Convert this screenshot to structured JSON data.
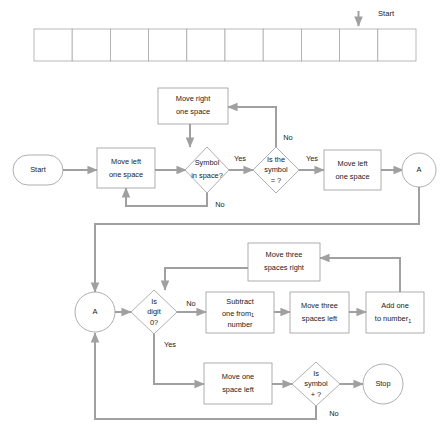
{
  "diagram": {
    "title_hidden": "",
    "colors": {
      "shape_border": "#9a9a9a",
      "connector": "#a0a0a0",
      "text": "#1a1a1a",
      "background": "#ffffff"
    },
    "tape": {
      "label": "Start",
      "cell_count": 10,
      "pointer_cell_index": 8,
      "cells": [
        "",
        "",
        "",
        "",
        "",
        "",
        "",
        "",
        "",
        ""
      ]
    },
    "nodes": {
      "start": {
        "label": "Start",
        "shape": "stadium"
      },
      "move_left_one_space_1": {
        "line1": "Move left",
        "line2": "one space",
        "shape": "process"
      },
      "symbol_in_space": {
        "line1": "Symbol",
        "line2": "in space?",
        "shape": "decision"
      },
      "move_right_one_space": {
        "line1": "Move right",
        "line2": "one space",
        "shape": "process"
      },
      "is_the_symbol_equals": {
        "line1": "Is the",
        "line2": "symbol",
        "line3": "= ?",
        "shape": "decision"
      },
      "move_left_one_space_2": {
        "line1": "Move left",
        "line2": "one space",
        "shape": "process"
      },
      "connector_a_top": {
        "label": "A",
        "shape": "connector"
      },
      "connector_a_bottom": {
        "label": "A",
        "shape": "connector"
      },
      "is_digit_0": {
        "line1": "Is",
        "line2": "digit",
        "line3": "0?",
        "shape": "decision"
      },
      "subtract_one": {
        "line1": "Subtract",
        "line2": "one from",
        "line2_sub": "1",
        "line3": "number",
        "shape": "process"
      },
      "move_three_spaces_left": {
        "line1": "Move three",
        "line2": "spaces left",
        "shape": "process"
      },
      "add_one_to_number": {
        "line1": "Add one",
        "line2": "to number",
        "line2_sub": "1",
        "shape": "process"
      },
      "move_three_spaces_right": {
        "line1": "Move three",
        "line2": "spaces right",
        "shape": "process"
      },
      "move_one_space_left": {
        "line1": "Move one",
        "line2": "space left",
        "shape": "process"
      },
      "is_symbol_plus": {
        "line1": "Is",
        "line2": "symbol",
        "line3": "+ ?",
        "shape": "decision"
      },
      "stop": {
        "label": "Stop",
        "shape": "terminator"
      }
    },
    "edge_labels": {
      "symbol_in_space_yes": "Yes",
      "symbol_in_space_no": "No",
      "is_the_symbol_yes": "Yes",
      "is_the_symbol_no": "No",
      "is_digit_0_no": "No",
      "is_digit_0_yes": "Yes",
      "is_symbol_plus_no": "No"
    }
  }
}
